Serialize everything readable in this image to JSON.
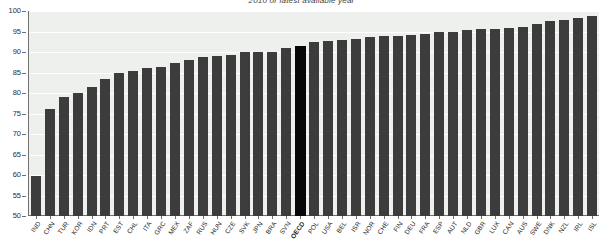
{
  "chart_data": {
    "type": "bar",
    "title": "2010 or latest available year",
    "xlabel": "",
    "ylabel": "",
    "ylim": [
      50,
      100
    ],
    "yticks": [
      100,
      95,
      90,
      85,
      80,
      75,
      70,
      65,
      60,
      55,
      50
    ],
    "grid": true,
    "legend": "none",
    "highlight_category": "OECD",
    "colors": {
      "bar": "#3c3c3c",
      "highlight_bar": "#070707",
      "plot_background": "#eef0ee",
      "gridline": "#ffffff",
      "axis": "#6f6f6f"
    },
    "categories": [
      "IND",
      "CHN",
      "TUR",
      "KOR",
      "IDN",
      "PRT",
      "EST",
      "CHL",
      "ITA",
      "GRC",
      "MEX",
      "ZAF",
      "RUS",
      "HUN",
      "CZE",
      "SVK",
      "JPN",
      "BRA",
      "SVN",
      "OECD",
      "POL",
      "USA",
      "BEL",
      "ISR",
      "NOR",
      "CHE",
      "FIN",
      "DEU",
      "FRA",
      "ESP",
      "AUT",
      "NLD",
      "GBR",
      "LUX",
      "CAN",
      "AUS",
      "SWE",
      "DNK",
      "NZL",
      "IRL",
      "ISL"
    ],
    "values": [
      59.8,
      76.0,
      79.0,
      80.0,
      81.5,
      83.5,
      84.8,
      85.4,
      86.2,
      86.4,
      87.4,
      88.0,
      88.8,
      89.0,
      89.2,
      90.0,
      90.1,
      90.1,
      91.1,
      91.4,
      92.5,
      92.7,
      93.0,
      93.2,
      93.6,
      93.9,
      94.0,
      94.2,
      94.5,
      94.8,
      95.0,
      95.3,
      95.5,
      95.7,
      95.9,
      96.1,
      96.9,
      97.5,
      97.8,
      98.3,
      98.8
    ]
  }
}
